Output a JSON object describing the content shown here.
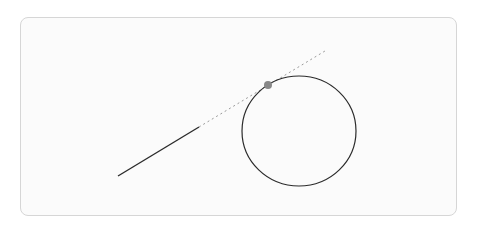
{
  "diagram": {
    "colors": {
      "segment": "#2b2b2b",
      "extension": "#9a9a9a",
      "circle": "#2b2b2b",
      "tangent_point": "#888888",
      "card_border": "#d6d6d6"
    },
    "elements": [
      "line-segment",
      "dashed-extension",
      "circle",
      "tangent-point"
    ]
  }
}
